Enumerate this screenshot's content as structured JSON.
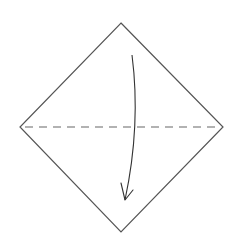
{
  "diagram": {
    "title": "Origami valley fold: fold top corner down to bottom corner",
    "colors": {
      "background": "#ffffff",
      "paper_outline": "#555555",
      "fold_line": "#666666",
      "arrow": "#333333"
    },
    "paper": {
      "shape": "square rotated 45deg (diamond)",
      "vertices": {
        "top": [
          121,
          23
        ],
        "right": [
          223,
          127
        ],
        "bottom": [
          121,
          232
        ],
        "left": [
          20,
          127
        ]
      }
    },
    "fold_line": {
      "type": "valley-fold-dashed",
      "from": [
        25,
        127
      ],
      "to": [
        220,
        127
      ],
      "dash": "8 6"
    },
    "arrow": {
      "type": "curved-fold-direction-arrow",
      "start": [
        132,
        55
      ],
      "control": [
        140,
        125
      ],
      "end": [
        125,
        200
      ],
      "head": "open-chevron",
      "meaning": "fold top half down"
    }
  }
}
